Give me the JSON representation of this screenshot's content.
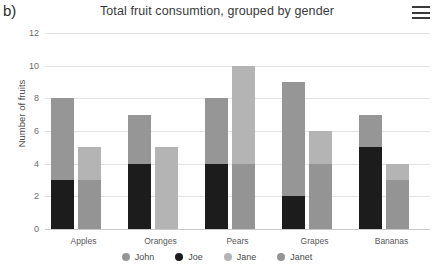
{
  "panel": {
    "label": "b)"
  },
  "header": {
    "title": "Total fruit consumtion, grouped by gender",
    "menu_icon": "hamburger-menu-icon"
  },
  "legend": {
    "position": "bottom",
    "items": [
      {
        "label": "John",
        "color": "#969696"
      },
      {
        "label": "Joe",
        "color": "#1c1c1c"
      },
      {
        "label": "Jane",
        "color": "#b4b4b4"
      },
      {
        "label": "Janet",
        "color": "#949494"
      }
    ]
  },
  "yaxis": {
    "label": "Number of fruits",
    "ticks": [
      "0",
      "2",
      "4",
      "6",
      "8",
      "10",
      "12"
    ],
    "min": 0,
    "max": 12
  },
  "chart_data": {
    "type": "bar",
    "subtype": "stacked-grouped",
    "title": "Total fruit consumtion, grouped by gender",
    "xlabel": "",
    "ylabel": "Number of fruits",
    "ylim": [
      0,
      12
    ],
    "ytick_step": 2,
    "grid": true,
    "legend_position": "bottom",
    "categories": [
      "Apples",
      "Oranges",
      "Pears",
      "Grapes",
      "Bananas"
    ],
    "stack_groups": [
      {
        "name": "male",
        "series": [
          "Joe",
          "John"
        ]
      },
      {
        "name": "female",
        "series": [
          "Janet",
          "Jane"
        ]
      }
    ],
    "series": [
      {
        "name": "John",
        "color": "#969696",
        "stack": "male",
        "values": [
          5,
          3,
          4,
          7,
          2
        ]
      },
      {
        "name": "Joe",
        "color": "#1c1c1c",
        "stack": "male",
        "values": [
          3,
          4,
          4,
          2,
          5
        ]
      },
      {
        "name": "Jane",
        "color": "#b4b4b4",
        "stack": "female",
        "values": [
          2,
          5,
          6,
          2,
          1
        ]
      },
      {
        "name": "Janet",
        "color": "#949494",
        "stack": "female",
        "values": [
          3,
          0,
          4,
          4,
          3
        ]
      }
    ],
    "stack_totals": {
      "male": [
        8,
        7,
        8,
        9,
        7
      ],
      "female": [
        5,
        5,
        10,
        6,
        4
      ]
    }
  }
}
